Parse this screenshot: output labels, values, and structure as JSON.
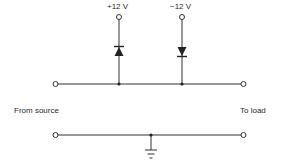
{
  "diagram": {
    "type": "diode clamp circuit",
    "labels": {
      "supply_positive": "+12 V",
      "supply_negative": "−12 V",
      "input": "From source",
      "output": "To load"
    },
    "components": [
      {
        "id": "D1",
        "kind": "diode",
        "connects": [
          "signal-line",
          "+12 V"
        ],
        "orientation": "anode at line, cathode to +12 V"
      },
      {
        "id": "D2",
        "kind": "diode",
        "connects": [
          "-12 V",
          "signal-line"
        ],
        "orientation": "anode to -12 V, cathode at line"
      },
      {
        "id": "GND",
        "kind": "ground",
        "connects": [
          "return-line"
        ]
      }
    ],
    "colors": {
      "wire": "#333333",
      "background": "#ffffff"
    }
  }
}
